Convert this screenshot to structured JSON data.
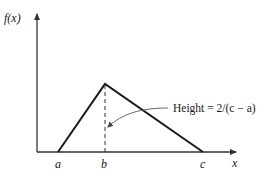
{
  "figure": {
    "type": "triangular-distribution-pdf",
    "y_axis_label": "f(x)",
    "x_axis_label": "x",
    "points": {
      "a": {
        "label": "a",
        "x": 58,
        "y": 152
      },
      "b": {
        "label": "b",
        "x": 105,
        "y": 84
      },
      "c": {
        "label": "c",
        "x": 203,
        "y": 152
      }
    },
    "annotation": {
      "text": "Height = 2/(c − a)",
      "target": "dashed-height-line"
    },
    "colors": {
      "line": "#1a1a1a",
      "axis": "#333333",
      "pointer": "#555555"
    }
  }
}
